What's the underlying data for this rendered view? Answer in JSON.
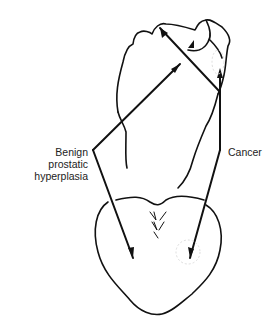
{
  "diagram": {
    "labels": {
      "bph_line1": "Benign prostatic",
      "bph_line2": "hyperplasia",
      "cancer": "Cancer"
    },
    "colors": {
      "line": "#111111",
      "background": "#ffffff"
    }
  }
}
